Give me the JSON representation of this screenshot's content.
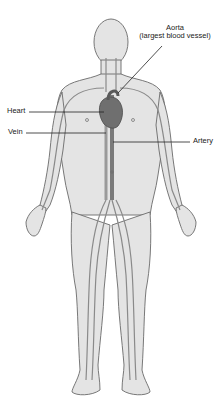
{
  "diagram": {
    "labels": {
      "aorta_line1": "Aorta",
      "aorta_line2": "(largest blood vessel)",
      "heart": "Heart",
      "vein": "Vein",
      "artery": "Artery"
    },
    "colors": {
      "skin": "#e4e4e4",
      "outline": "#6a6a6a",
      "vessel": "#8a8a8a",
      "heart": "#6f6f6f",
      "text": "#222222",
      "background": "#ffffff"
    }
  }
}
